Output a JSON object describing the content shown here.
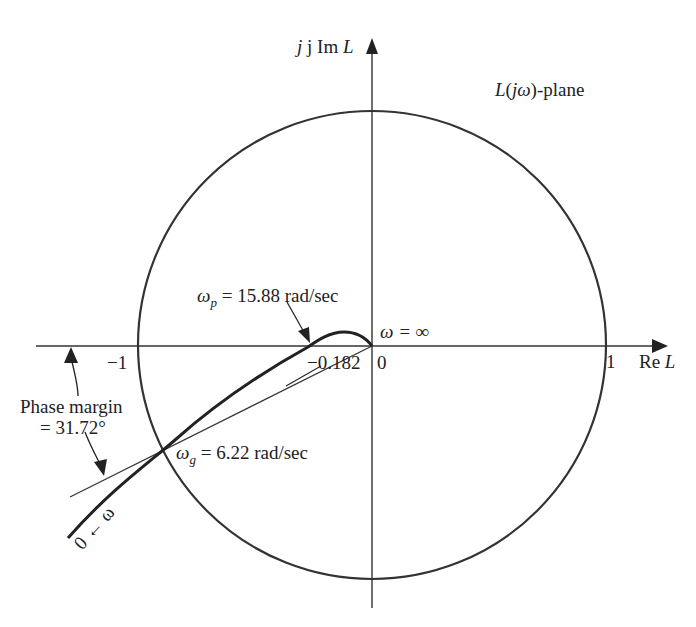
{
  "diagram": {
    "type": "nyquist-plot",
    "plane_label": "L(jω)-plane",
    "axes": {
      "imag_label_prefix": "j Im ",
      "imag_label_var": "L",
      "real_label_prefix": "Re ",
      "real_label_var": "L"
    },
    "ticks": {
      "minus_one": "−1",
      "zero": "0",
      "one": "1"
    },
    "annotations": {
      "omega_p_symbol": "ω",
      "omega_p_sub": "p",
      "omega_p_value": " = 15.88 rad/sec",
      "omega_g_symbol": "ω",
      "omega_g_sub": "g",
      "omega_g_value": " = 6.22 rad/sec",
      "omega_inf": "ω = ∞",
      "crossing_value": "−0.182",
      "phase_margin_line1": "Phase margin",
      "phase_margin_line2": "= 31.72°",
      "start_label": "0 ← ω"
    },
    "colors": {
      "stroke": "#222222",
      "background": "#ffffff"
    }
  }
}
